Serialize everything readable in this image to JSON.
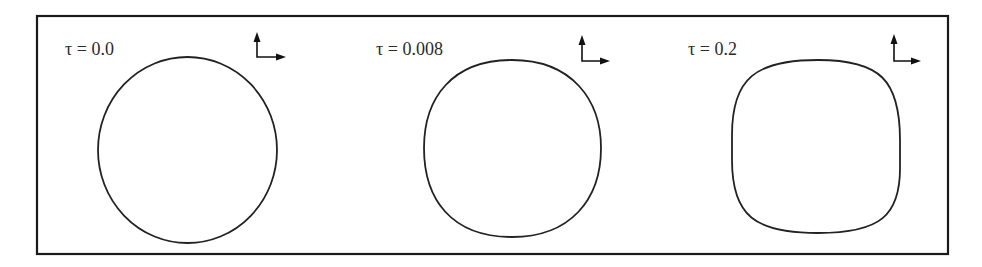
{
  "figure": {
    "frame": {
      "x": 37,
      "y": 16,
      "width": 911,
      "height": 238,
      "stroke": "#1a1a1a"
    },
    "panels": [
      {
        "label": "τ = 0.0",
        "tau": 0.0,
        "label_pos": [
          65,
          55
        ],
        "shape": "circle",
        "shape_bbox": [
          98,
          57,
          277,
          243
        ],
        "axis_origin": [
          257,
          57
        ],
        "axis_up_tip": [
          257,
          33
        ],
        "axis_right_tip": [
          285,
          57
        ]
      },
      {
        "label": "τ = 0.008",
        "tau": 0.008,
        "label_pos": [
          376,
          55
        ],
        "shape": "rounded-circle",
        "shape_bbox": [
          424,
          60,
          601,
          237
        ],
        "axis_origin": [
          582,
          61
        ],
        "axis_up_tip": [
          582,
          35
        ],
        "axis_right_tip": [
          609,
          61
        ]
      },
      {
        "label": "τ = 0.2",
        "tau": 0.2,
        "label_pos": [
          688,
          55
        ],
        "shape": "rounded-square",
        "shape_bbox": [
          732,
          60,
          900,
          233
        ],
        "axis_origin": [
          894,
          61
        ],
        "axis_up_tip": [
          894,
          34
        ],
        "axis_right_tip": [
          920,
          61
        ]
      }
    ],
    "colors": {
      "line": "#222222",
      "text": "#2a2a2a",
      "background": "#ffffff"
    }
  }
}
